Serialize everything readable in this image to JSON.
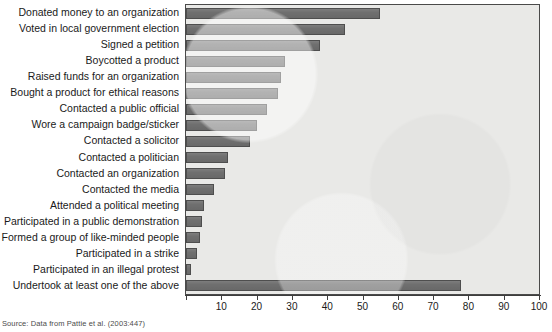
{
  "chart_data": {
    "type": "bar",
    "orientation": "horizontal",
    "title": "",
    "xlabel": "",
    "ylabel": "",
    "xlim": [
      0,
      100
    ],
    "xticks": [
      0,
      10,
      20,
      30,
      40,
      50,
      60,
      70,
      80,
      90,
      100
    ],
    "xtick_labels": [
      "",
      "10",
      "20",
      "30",
      "40",
      "50",
      "60",
      "70",
      "80",
      "90",
      "100"
    ],
    "grid": false,
    "legend": null,
    "bar_color": "#6f6f6f",
    "bar_edge_color": "#4e4e4e",
    "plot_background": "#e9e9e7",
    "categories": [
      "Donated money to an organization",
      "Voted in local government election",
      "Signed a petition",
      "Boycotted a product",
      "Raised funds for an organization",
      "Bought a product for ethical reasons",
      "Contacted a public official",
      "Wore a campaign badge/sticker",
      "Contacted a solicitor",
      "Contacted a politician",
      "Contacted an organization",
      "Contacted the media",
      "Attended a political meeting",
      "Participated in a public demonstration",
      "Formed a group of like-minded people",
      "Participated in a strike",
      "Participated in an illegal protest",
      "Undertook at least one of the above"
    ],
    "values": [
      55,
      45,
      38,
      28,
      27,
      26,
      23,
      20,
      18,
      12,
      11,
      8,
      5,
      4.5,
      4,
      3,
      1.5,
      78
    ]
  },
  "source": {
    "note": "Source: Data from Pattie et al. (2003:447)"
  }
}
